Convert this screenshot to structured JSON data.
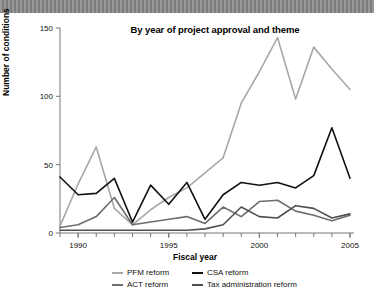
{
  "banner": {
    "name": "top-gray-banner"
  },
  "chart_data": {
    "type": "line",
    "title": "By year of project approval and theme",
    "xlabel": "Fiscal year",
    "ylabel": "Number of conditions",
    "xlim": [
      1989,
      2005
    ],
    "ylim": [
      0,
      150
    ],
    "yticks": [
      0,
      50,
      100,
      150
    ],
    "ytick_labels": [
      "0",
      "50",
      "100",
      "150"
    ],
    "xticks": [
      1990,
      1995,
      2000,
      2005
    ],
    "xtick_labels": [
      "1990",
      "1995",
      "2000",
      "2005"
    ],
    "minor_xticks": [
      1989,
      1990,
      1991,
      1992,
      1993,
      1994,
      1995,
      1996,
      1997,
      1998,
      1999,
      2000,
      2001,
      2002,
      2003,
      2004,
      2005
    ],
    "grid": false,
    "legend_position": "bottom",
    "x": [
      1989,
      1990,
      1991,
      1992,
      1993,
      1994,
      1995,
      1996,
      1997,
      1998,
      1999,
      2000,
      2001,
      2002,
      2003,
      2004,
      2005
    ],
    "series": [
      {
        "name": "PFM reform",
        "color": "#a8a8a8",
        "values": [
          5,
          36,
          63,
          18,
          6,
          17,
          26,
          33,
          44,
          55,
          95,
          118,
          143,
          98,
          136,
          120,
          105
        ]
      },
      {
        "name": "CSA reform",
        "color": "#111111",
        "values": [
          41,
          28,
          29,
          40,
          8,
          35,
          21,
          37,
          10,
          28,
          37,
          35,
          37,
          33,
          42,
          77,
          40
        ]
      },
      {
        "name": "ACT reform",
        "color": "#6d6d6d",
        "values": [
          4,
          6,
          12,
          26,
          6,
          8,
          10,
          12,
          7,
          19,
          12,
          23,
          24,
          16,
          13,
          9,
          13
        ]
      },
      {
        "name": "Tax administration reform",
        "color": "#4f4f4f",
        "values": [
          2,
          2,
          2,
          2,
          2,
          2,
          2,
          2,
          3,
          6,
          19,
          12,
          11,
          20,
          18,
          11,
          14
        ]
      }
    ]
  }
}
